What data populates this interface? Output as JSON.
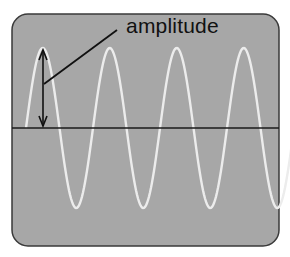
{
  "diagram": {
    "title_label": "amplitude",
    "panel": {
      "background": "#a7a7a7",
      "border": "#333333"
    },
    "wave": {
      "color": "#ececec",
      "cycles": 4,
      "type": "sine"
    },
    "baseline": {
      "color": "#1a1a1a"
    },
    "annotation": {
      "arrow": "double-headed vertical arrow from baseline to first peak",
      "pointer_line": "line from label to arrow"
    }
  }
}
